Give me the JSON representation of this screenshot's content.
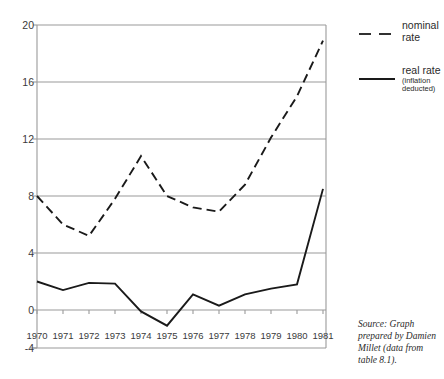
{
  "chart_data": {
    "type": "line",
    "title": "",
    "subtitle": "",
    "xlabel": "",
    "ylabel": "",
    "categories": [
      "1970",
      "1971",
      "1972",
      "1973",
      "1974",
      "1975",
      "1976",
      "1977",
      "1978",
      "1979",
      "1980",
      "1981"
    ],
    "x": [
      1970,
      1971,
      1972,
      1973,
      1974,
      1975,
      1976,
      1977,
      1978,
      1979,
      1980,
      1981
    ],
    "series": [
      {
        "name": "nominal rate",
        "style": "dashed",
        "color": "#1a1a1a",
        "values": [
          8.0,
          6.0,
          5.2,
          7.8,
          10.8,
          8.0,
          7.2,
          6.9,
          8.8,
          12.1,
          15.0,
          18.9
        ]
      },
      {
        "name": "real rate",
        "style": "solid",
        "color": "#1a1a1a",
        "values": [
          2.0,
          1.4,
          1.9,
          1.85,
          -0.1,
          -1.1,
          1.1,
          0.3,
          1.1,
          1.5,
          1.8,
          8.5
        ]
      }
    ],
    "ylim": [
      -4,
      20
    ],
    "xlim": [
      1970,
      1981
    ],
    "yticks": [
      20,
      16,
      12,
      8,
      4,
      0,
      -4
    ],
    "ytick_labels": [
      "20",
      "16",
      "12",
      "8",
      "4",
      "0",
      "-4"
    ],
    "gridlines_y": [
      20,
      16,
      12,
      8,
      4,
      0
    ],
    "grid": true,
    "grid_color": "#9a9a9a",
    "legend_position": "right",
    "legend": [
      {
        "label": "nominal rate",
        "sub": "",
        "style": "dashed"
      },
      {
        "label": "real rate",
        "sub": "(inflation deducted)",
        "style": "solid"
      }
    ],
    "annotations": [
      "Source: Graph prepared by Damien Millet (data from table 8.1)."
    ]
  },
  "legend": {
    "items": [
      {
        "label": "nominal",
        "label2": "rate",
        "sub1": "",
        "sub2": ""
      },
      {
        "label": "real rate",
        "label2": "",
        "sub1": "(inflation",
        "sub2": "deducted)"
      }
    ]
  },
  "source": {
    "line1": "Source: Graph",
    "line2": "prepared by Damien",
    "line3": "Millet (data from",
    "line4": "table 8.1)."
  }
}
